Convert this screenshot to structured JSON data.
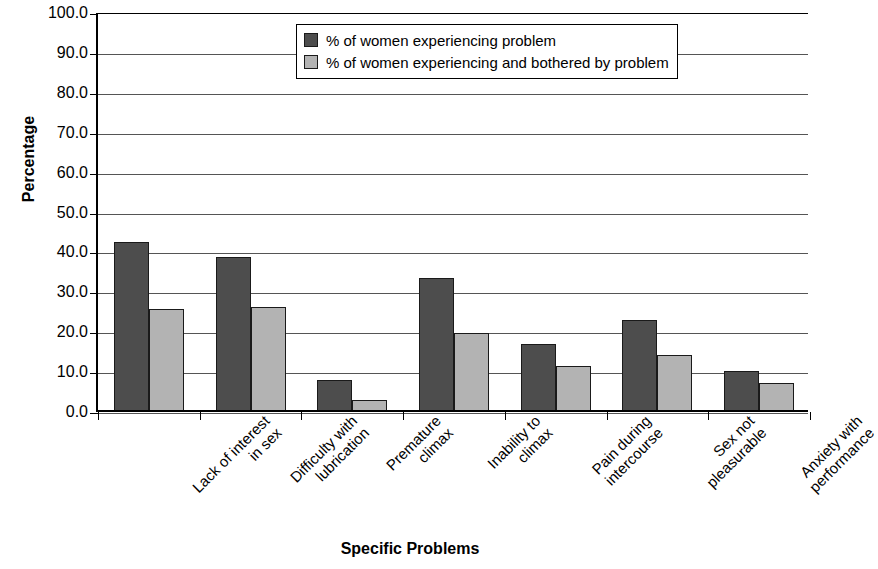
{
  "chart_data": {
    "type": "bar",
    "title": "",
    "xlabel": "Specific Problems",
    "ylabel": "Percentage",
    "ylim": [
      0,
      100
    ],
    "ytick_step": 10,
    "ytick_labels": [
      "100.0",
      "90.0",
      "80.0",
      "70.0",
      "60.0",
      "50.0",
      "40.0",
      "30.0",
      "20.0",
      "10.0",
      "0.0"
    ],
    "grid": "horizontal",
    "legend_position": "top-center",
    "categories": [
      "Lack of interest in sex",
      "Difficulty with lubrication",
      "Premature climax",
      "Inability to climax",
      "Pain during intercourse",
      "Sex not pleasurable",
      "Anxiety with performance"
    ],
    "category_lines": [
      [
        "Lack of interest",
        "in sex"
      ],
      [
        "Difficulty with",
        "lubrication"
      ],
      [
        "Premature",
        "climax"
      ],
      [
        "Inability to",
        "climax"
      ],
      [
        "Pain during",
        "intercourse"
      ],
      [
        "Sex not",
        "pleasurable"
      ],
      [
        "Anxiety with",
        "performance"
      ]
    ],
    "series": [
      {
        "name": "% of women experiencing problem",
        "color": "#4d4d4d",
        "values": [
          42.7,
          38.9,
          8.1,
          33.6,
          17.0,
          23.1,
          10.3
        ]
      },
      {
        "name": "% of women experiencing and bothered by problem",
        "color": "#b3b3b3",
        "values": [
          25.9,
          26.2,
          2.9,
          19.9,
          11.6,
          14.4,
          7.3
        ]
      }
    ]
  },
  "legend": {
    "entries": [
      {
        "label": "% of women experiencing problem",
        "swatch": "dark-swatch-icon"
      },
      {
        "label": "% of women experiencing and bothered by problem",
        "swatch": "light-swatch-icon"
      }
    ]
  }
}
